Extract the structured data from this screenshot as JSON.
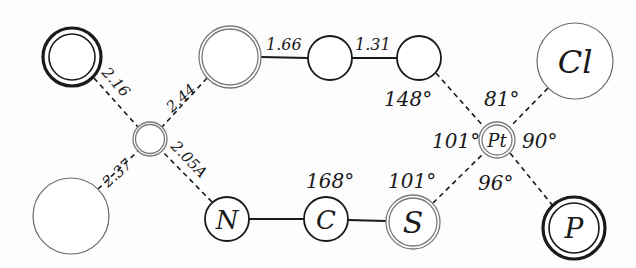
{
  "diagram": {
    "type": "molecular-structure",
    "atoms": [
      {
        "id": "a_tl",
        "label": "",
        "cx": 72,
        "cy": 57,
        "r": 29,
        "style": "double-bold"
      },
      {
        "id": "a_mid",
        "label": "",
        "cx": 150,
        "cy": 139,
        "r": 17,
        "style": "double-grey"
      },
      {
        "id": "a_bl",
        "label": "",
        "cx": 71,
        "cy": 216,
        "r": 38,
        "style": "thin-grey"
      },
      {
        "id": "a_top1",
        "label": "",
        "cx": 230,
        "cy": 57,
        "r": 31,
        "style": "double-grey"
      },
      {
        "id": "a_top2",
        "label": "",
        "cx": 330,
        "cy": 58,
        "r": 22,
        "style": "single"
      },
      {
        "id": "a_top3",
        "label": "",
        "cx": 419,
        "cy": 58,
        "r": 22,
        "style": "single"
      },
      {
        "id": "a_cl",
        "label": "Cl",
        "cx": 575,
        "cy": 61,
        "r": 38,
        "style": "thin-grey"
      },
      {
        "id": "a_pt",
        "label": "Pt",
        "cx": 497,
        "cy": 140,
        "r": 18,
        "style": "double-grey"
      },
      {
        "id": "a_p",
        "label": "P",
        "cx": 574,
        "cy": 228,
        "r": 31,
        "style": "double-bold"
      },
      {
        "id": "a_n",
        "label": "N",
        "cx": 227,
        "cy": 219,
        "r": 22,
        "style": "single"
      },
      {
        "id": "a_c",
        "label": "C",
        "cx": 326,
        "cy": 219,
        "r": 22,
        "style": "single"
      },
      {
        "id": "a_s",
        "label": "S",
        "cx": 413,
        "cy": 222,
        "r": 27,
        "style": "double-grey"
      }
    ],
    "bond_labels": {
      "b_tl_mid": "2.16",
      "b_top1_mid": "2.44",
      "b_bl_mid": "2.37",
      "b_n_mid": "2.05A",
      "b_top1_top2": "1.66",
      "b_top2_top3": "1.31"
    },
    "angle_labels": {
      "ang_top3": "148°",
      "ang_pt_top": "81°",
      "ang_pt_left": "101°",
      "ang_pt_right": "90°",
      "ang_pt_bottom": "96°",
      "ang_s": "101°",
      "ang_c": "168°"
    },
    "atom_labels": {
      "cl": "Cl",
      "pt": "Pt",
      "p": "P",
      "n": "N",
      "c": "C",
      "s": "S"
    },
    "colors": {
      "ink": "#1a1a1a",
      "grey_ring": "#7a7a7a",
      "background": "#fdfdfd"
    }
  }
}
